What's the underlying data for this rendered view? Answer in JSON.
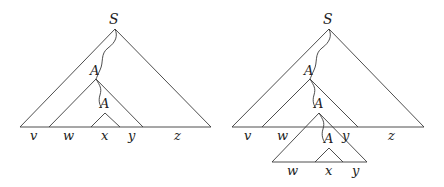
{
  "figure": {
    "left_tree": {
      "root_label": "S",
      "repeated_nonterminal": "A",
      "inner_nonterminal": "A",
      "yield_labels": [
        "v",
        "w",
        "x",
        "y",
        "z"
      ]
    },
    "right_tree": {
      "root_label": "S",
      "repeated_nonterminals": [
        "A",
        "A",
        "A"
      ],
      "upper_yield_labels": [
        "v",
        "w",
        "y",
        "z"
      ],
      "lower_yield_labels": [
        "w",
        "x",
        "y"
      ]
    }
  }
}
